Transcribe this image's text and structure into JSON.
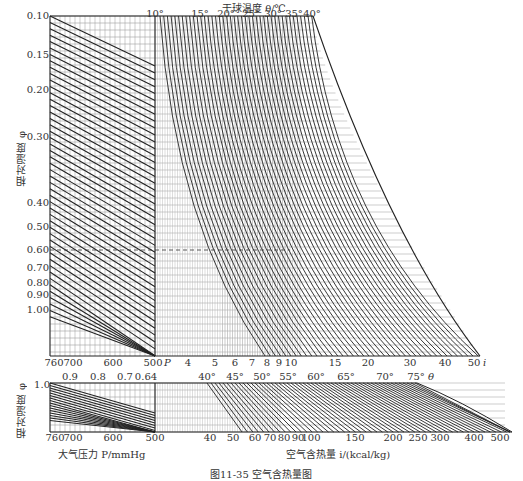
{
  "chart_data": {
    "type": "nomogram",
    "title": "空气含热量图",
    "caption": "图11-35  空气含热量图",
    "top_axis": {
      "label": "干球温度 θ/℃",
      "ticks": [
        "10°",
        "15°",
        "20°",
        "25°",
        "30°",
        "35°",
        "40°"
      ]
    },
    "left_axis": {
      "label": "相对湿度 φ",
      "ticks": [
        "0.10",
        "0.15",
        "0.20",
        "0.30",
        "0.40",
        "0.50",
        "0.60",
        "0.70",
        "0.80",
        "0.90",
        "1.00"
      ]
    },
    "main_bottom_axis": {
      "pressure_ticks": [
        "760",
        "700",
        "600",
        "500"
      ],
      "pressure_symbol": "P",
      "enthalpy_ticks": [
        "4",
        "5",
        "6",
        "7",
        "8",
        "9",
        "10",
        "15",
        "20",
        "30",
        "40",
        "50"
      ],
      "enthalpy_symbol": "i"
    },
    "lower_top_axis": {
      "phi_ticks": [
        "0.9",
        "0.8",
        "0.7",
        "0.64"
      ],
      "theta_ticks": [
        "40°",
        "45°",
        "50°",
        "55°",
        "60°",
        "65°",
        "70°",
        "75°"
      ],
      "theta_symbol": "θ"
    },
    "lower_left_axis": {
      "label": "相对湿度 φ",
      "ticks": [
        "1.0"
      ]
    },
    "lower_bottom_axis": {
      "pressure_ticks": [
        "760",
        "700",
        "600",
        "500"
      ],
      "pressure_label": "大气压力 P/mmHg",
      "enthalpy_ticks": [
        "40",
        "50",
        "60",
        "70",
        "80",
        "90",
        "100",
        "150",
        "200",
        "250",
        "300",
        "400",
        "500"
      ],
      "enthalpy_label": "空气含热量 i/(kcal/kg)"
    },
    "annotations": [
      "dashed reference line at φ = 0.60"
    ],
    "grid": true
  }
}
